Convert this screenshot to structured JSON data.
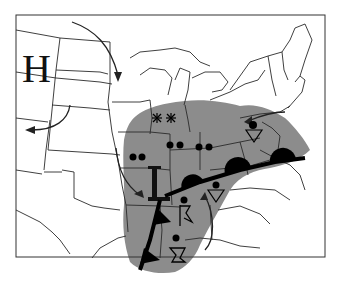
{
  "map": {
    "title": "",
    "type": "weather-map",
    "region": "United States (Central and Eastern)",
    "pressure_centers": [
      {
        "type": "high",
        "label": "H",
        "x": 40,
        "y": 70
      },
      {
        "type": "low",
        "label": "L",
        "x": 158,
        "y": 215
      }
    ],
    "fronts": [
      {
        "type": "cold-front",
        "description": "extends south-southwest from low"
      },
      {
        "type": "warm/stationary-front",
        "description": "extends east-northeast from low with semicircles"
      }
    ],
    "weather_symbols": [
      "rain",
      "snow",
      "thunderstorm",
      "showers"
    ],
    "colors": {
      "precipitation": "#8c8c8c",
      "lines": "#222222",
      "background": "#ffffff",
      "fronts": "#000000"
    }
  }
}
